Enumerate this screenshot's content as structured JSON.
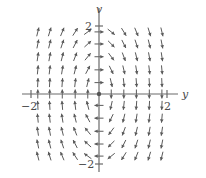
{
  "chart_data": {
    "type": "quiver",
    "title": "",
    "xlabel": "y",
    "ylabel": "v",
    "xlim": [
      -2,
      2
    ],
    "ylim": [
      -2,
      2
    ],
    "x_ticks": [
      "-2",
      "2"
    ],
    "y_ticks": [
      "2",
      "-2"
    ],
    "grid": false,
    "legend": null,
    "field_description": "Direction field: arrows point up for y<0, down for y>0; near v-axis arrows point right for v>0 and left for v<0 (rotation clockwise about origin)",
    "field": {
      "dy": "v",
      "dv": "-4*y"
    },
    "grid_x": [
      -1.8,
      -1.45,
      -1.08,
      -0.7,
      -0.33,
      0,
      0.36,
      0.73,
      1.1,
      1.48,
      1.85
    ],
    "grid_v": [
      1.8,
      1.45,
      1.08,
      0.7,
      0.33,
      0,
      -0.33,
      -0.7,
      -1.08,
      -1.45,
      -1.8
    ]
  },
  "axes": {
    "x_label": "y",
    "y_label": "v",
    "x_min_label": "−2",
    "x_max_label": "2",
    "y_max_label": "2",
    "y_min_label": "−2"
  }
}
